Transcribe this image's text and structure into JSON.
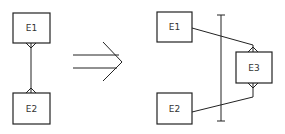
{
  "diagram": {
    "type": "er-transformation",
    "colors": {
      "stroke": "#222222",
      "background": "#ffffff",
      "text": "#333333"
    },
    "left": {
      "entities": [
        {
          "id": "E1",
          "label": "E1"
        },
        {
          "id": "E2",
          "label": "E2"
        }
      ],
      "relationships": [
        {
          "from": "E1",
          "to": "E2",
          "cardinality": "many-to-many"
        }
      ]
    },
    "arrow": {
      "label": "",
      "icon": "double-arrow-right-icon"
    },
    "right": {
      "entities": [
        {
          "id": "E1",
          "label": "E1"
        },
        {
          "id": "E2",
          "label": "E2"
        },
        {
          "id": "E3",
          "label": "E3"
        }
      ],
      "relationships": [
        {
          "from": "E1",
          "to": "E3",
          "cardinality": "one-to-many"
        },
        {
          "from": "E2",
          "to": "E3",
          "cardinality": "one-to-many"
        }
      ],
      "divider": "vertical-bar"
    }
  }
}
